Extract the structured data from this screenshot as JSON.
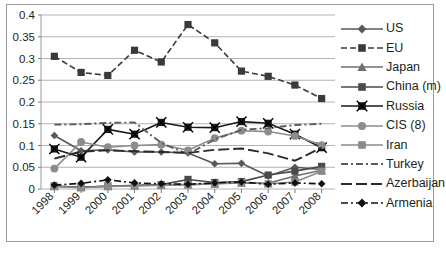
{
  "chart_data": {
    "type": "line",
    "title": "",
    "xlabel": "",
    "ylabel": "",
    "categories": [
      "1998",
      "1999",
      "2000",
      "2001",
      "2002",
      "2003",
      "2004",
      "2005",
      "2006",
      "2007",
      "2008"
    ],
    "ylim": [
      0,
      0.4
    ],
    "yticks": [
      "0",
      "0.05",
      "0.1",
      "0.15",
      "0.2",
      "0.25",
      "0.3",
      "0.35",
      "0.4"
    ],
    "ytick_values": [
      0,
      0.05,
      0.1,
      0.15,
      0.2,
      0.25,
      0.3,
      0.35,
      0.4
    ],
    "grid": true,
    "legend_position": "right",
    "series": [
      {
        "name": "US",
        "marker": "diamond",
        "line": "solid",
        "color": "#595959",
        "values": [
          0.123,
          0.088,
          0.09,
          0.085,
          0.085,
          0.083,
          0.058,
          0.059,
          0.03,
          0.05,
          0.045
        ]
      },
      {
        "name": "EU",
        "marker": "square",
        "line": "dashed",
        "color": "#3a3a3a",
        "values": [
          0.305,
          0.268,
          0.261,
          0.319,
          0.292,
          0.378,
          0.336,
          0.271,
          0.259,
          0.239,
          0.208
        ]
      },
      {
        "name": "Japan",
        "marker": "triangle",
        "line": "solid",
        "color": "#6e6e6e",
        "values": [
          0.006,
          0.004,
          0.006,
          0.008,
          0.009,
          0.01,
          0.012,
          0.014,
          0.013,
          0.03,
          0.043
        ]
      },
      {
        "name": "China (m)",
        "marker": "square",
        "line": "solid",
        "color": "#4a4a4a",
        "values": [
          0.007,
          0.004,
          0.007,
          0.008,
          0.01,
          0.022,
          0.015,
          0.017,
          0.032,
          0.041,
          0.052
        ]
      },
      {
        "name": "Russia",
        "marker": "x-square",
        "line": "solid",
        "color": "#1a1a1a",
        "values": [
          0.092,
          0.073,
          0.137,
          0.126,
          0.153,
          0.142,
          0.141,
          0.155,
          0.151,
          0.126,
          0.095
        ]
      },
      {
        "name": "CIS (8)",
        "marker": "circle",
        "line": "solid",
        "color": "#8c8c8c",
        "values": [
          0.047,
          0.108,
          0.096,
          0.1,
          0.102,
          0.089,
          0.117,
          0.134,
          0.132,
          0.122,
          0.101
        ]
      },
      {
        "name": "Iran",
        "marker": "square",
        "line": "solid",
        "color": "#8a8a8a",
        "values": [
          0.006,
          0.003,
          0.006,
          0.007,
          0.009,
          0.01,
          0.012,
          0.015,
          0.012,
          0.016,
          0.041
        ]
      },
      {
        "name": "Turkey",
        "marker": "none",
        "line": "dash-dot",
        "color": "#5c5c5c",
        "values": [
          0.148,
          0.149,
          0.152,
          0.153,
          0.106,
          0.08,
          0.114,
          0.136,
          0.14,
          0.147,
          0.15
        ]
      },
      {
        "name": "Azerbaijan",
        "marker": "none",
        "line": "long-dash",
        "color": "#2b2b2b",
        "values": [
          0.07,
          0.086,
          0.089,
          0.087,
          0.085,
          0.083,
          0.09,
          0.093,
          0.082,
          0.065,
          0.095
        ]
      },
      {
        "name": "Armenia",
        "marker": "diamond",
        "line": "dash-dot",
        "color": "#111111",
        "values": [
          0.009,
          0.013,
          0.021,
          0.014,
          0.012,
          0.011,
          0.014,
          0.016,
          0.011,
          0.014,
          0.012
        ]
      }
    ]
  }
}
